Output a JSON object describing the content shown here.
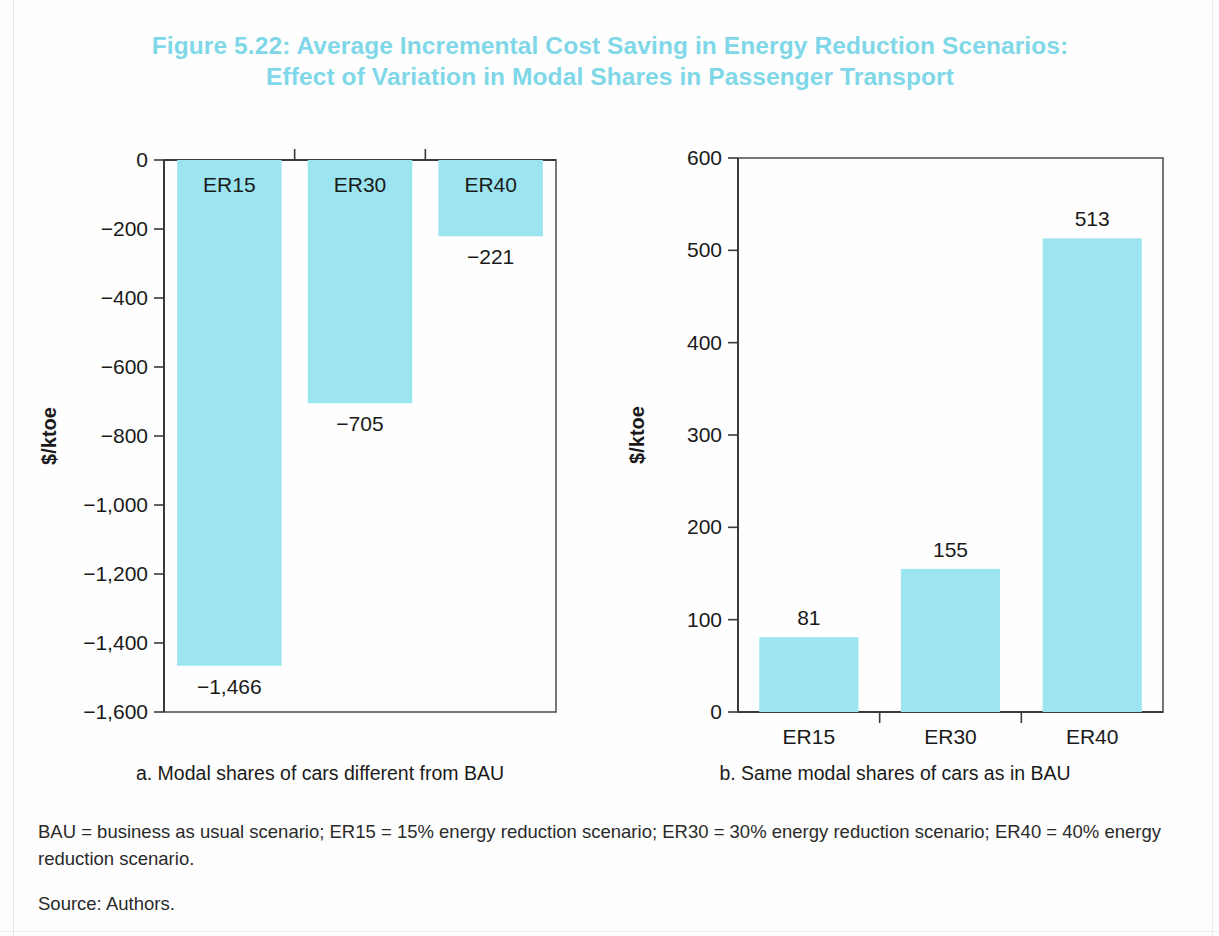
{
  "figure": {
    "title_line1": "Figure 5.22: Average Incremental Cost Saving in Energy Reduction Scenarios:",
    "title_line2": "Effect of Variation in Modal Shares in Passenger Transport",
    "title_color": "#7fd7e8",
    "bar_color": "#9ce5f0",
    "notes": "BAU = business as usual scenario; ER15 = 15% energy reduction scenario; ER30 = 30% energy reduction scenario; ER40 = 40% energy reduction scenario.",
    "source": "Source: Authors."
  },
  "chart_data": [
    {
      "id": "a",
      "type": "bar",
      "title": "",
      "caption": "a. Modal shares of cars different from BAU",
      "categories": [
        "ER15",
        "ER30",
        "ER40"
      ],
      "values": [
        -1466,
        -705,
        -221
      ],
      "value_labels": [
        "−1,466",
        "−705",
        "−221"
      ],
      "category_label_position": "inside-top",
      "xlabel": "",
      "ylabel": "$/ktoe",
      "ylim": [
        -1600,
        0
      ],
      "yticks": [
        0,
        -200,
        -400,
        -600,
        -800,
        -1000,
        -1200,
        -1400,
        -1600
      ],
      "ytick_labels": [
        "0",
        "−200",
        "−400",
        "−600",
        "−800",
        "−1,000",
        "−1,200",
        "−1,400",
        "−1,600"
      ],
      "grid": false,
      "legend": "none"
    },
    {
      "id": "b",
      "type": "bar",
      "title": "",
      "caption": "b. Same modal shares of cars as in BAU",
      "categories": [
        "ER15",
        "ER30",
        "ER40"
      ],
      "values": [
        81,
        155,
        513
      ],
      "value_labels": [
        "81",
        "155",
        "513"
      ],
      "category_label_position": "below-axis",
      "xlabel": "",
      "ylabel": "$/ktoe",
      "ylim": [
        0,
        600
      ],
      "yticks": [
        0,
        100,
        200,
        300,
        400,
        500,
        600
      ],
      "ytick_labels": [
        "0",
        "100",
        "200",
        "300",
        "400",
        "500",
        "600"
      ],
      "grid": false,
      "legend": "none"
    }
  ]
}
